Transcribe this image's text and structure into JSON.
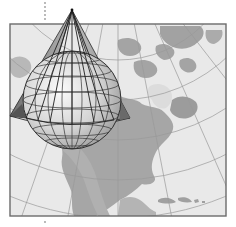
{
  "figure": {
    "colors": {
      "background": "#ffffff",
      "frame": "#6b6b6b",
      "ocean": "#e9e9e9",
      "land": "#a8a8a8",
      "land_dark": "#8f8f8f",
      "graticule_map": "#9a9a9a",
      "globe_light": "#f4f4f4",
      "globe_dark": "#a9a9a9",
      "globe_lines": "#333333",
      "cone_fill": "#8a8a8a",
      "cone_edge": "#2a2a2a",
      "axis_dots": "#9a9a9a"
    }
  }
}
